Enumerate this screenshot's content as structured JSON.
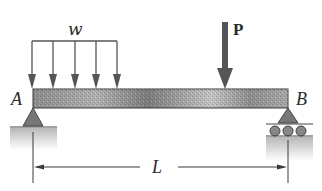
{
  "figure": {
    "beam": {
      "left_end": "A",
      "right_end": "B"
    },
    "labels": {
      "distributed_load": "w",
      "point_load": "P",
      "left_support": "A",
      "right_support": "B",
      "span": "L"
    },
    "supports": {
      "A": "pin",
      "B": "roller"
    },
    "distributed_load_arrow_count": 5,
    "colors": {
      "beam_dark": "#5a5a5a",
      "beam_light": "#bdbdbd",
      "arrow": "#555555",
      "support": "#6e6e6e",
      "ground": "#c8c8c8",
      "line": "#3a3a3a"
    }
  }
}
